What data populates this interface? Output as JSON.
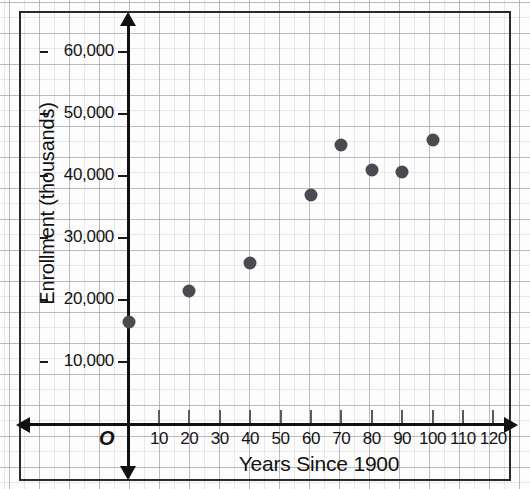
{
  "chart_data": {
    "type": "scatter",
    "title": "",
    "xlabel": "Years Since 1900",
    "ylabel": "Enrollment (thousands)",
    "origin_label": "O",
    "xlim": [
      0,
      125
    ],
    "ylim": [
      0,
      65000
    ],
    "grid": true,
    "legend": null,
    "x_ticks": [
      10,
      20,
      30,
      40,
      50,
      60,
      70,
      80,
      90,
      100,
      110,
      120
    ],
    "x_tick_labels": [
      "10",
      "20",
      "30",
      "40",
      "50",
      "60",
      "70",
      "80",
      "90",
      "100",
      "110",
      "120"
    ],
    "y_ticks": [
      10000,
      20000,
      30000,
      40000,
      50000,
      60000
    ],
    "y_tick_labels": [
      "10,000",
      "20,000",
      "30,000",
      "40,000",
      "50,000",
      "60,000"
    ],
    "points": [
      {
        "x": 0,
        "y": 16500
      },
      {
        "x": 20,
        "y": 21500
      },
      {
        "x": 40,
        "y": 26000
      },
      {
        "x": 60,
        "y": 37000
      },
      {
        "x": 70,
        "y": 45000
      },
      {
        "x": 80,
        "y": 41000
      },
      {
        "x": 90,
        "y": 40700
      },
      {
        "x": 100,
        "y": 45800
      }
    ],
    "marker_color": "#4a4a50",
    "axis_color": "#111111",
    "grid_color": "#96969b"
  }
}
